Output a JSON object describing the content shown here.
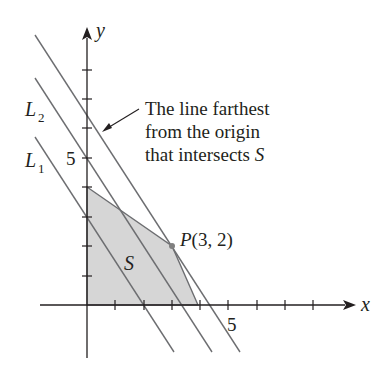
{
  "figure": {
    "axes": {
      "x_label": "x",
      "y_label": "y",
      "x_tick_label": "5",
      "y_tick_label": "5",
      "x_range": [
        0,
        8
      ],
      "y_range": [
        0,
        8
      ]
    },
    "region": {
      "label": "S",
      "vertices": [
        [
          0,
          0
        ],
        [
          0,
          4
        ],
        [
          3,
          2
        ],
        [
          4,
          0
        ]
      ],
      "fill": "#d9d9d9"
    },
    "point": {
      "label": "P(3, 2)",
      "x": 3,
      "y": 2
    },
    "lines": [
      {
        "label": "L1",
        "label_main": "L",
        "label_sub": "1",
        "equation": "3x + 2y = 6"
      },
      {
        "label": "L2",
        "label_main": "L",
        "label_sub": "2",
        "equation": "3x + 2y = 10"
      },
      {
        "label": "",
        "equation": "3x + 2y = 13"
      }
    ],
    "annotation": {
      "line1": "The line farthest",
      "line2": "from the origin",
      "line3_prefix": "that intersects ",
      "line3_italic": "S"
    },
    "colors": {
      "line": "#6d6e71",
      "axis": "#231f20",
      "region": "#d9d9d9",
      "point": "#808080"
    }
  }
}
